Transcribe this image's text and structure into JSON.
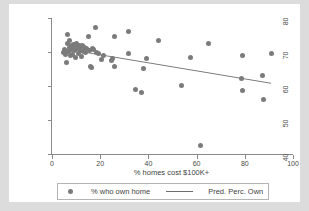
{
  "chart_data": {
    "type": "scatter",
    "title": "",
    "xlabel": "% homes cost $100K+",
    "ylabel": "",
    "xlim": [
      0,
      100
    ],
    "ylim": [
      40,
      80
    ],
    "xticks": [
      0,
      20,
      40,
      60,
      80,
      100
    ],
    "yticks": [
      40,
      50,
      60,
      70,
      80
    ],
    "grid": false,
    "legend_position": "below",
    "marker_color": "#7b7b7b",
    "line_color": "#6e6e6e",
    "plot_background": "#ffffff",
    "figure_background": "#dcdcdc",
    "series": [
      {
        "name": "% who own home",
        "type": "scatter",
        "points": [
          [
            4.6,
            69.9
          ],
          [
            5.2,
            70.8
          ],
          [
            5.6,
            69.4
          ],
          [
            6.0,
            66.9
          ],
          [
            6.3,
            75.1
          ],
          [
            6.6,
            72.6
          ],
          [
            6.8,
            70.2
          ],
          [
            7.1,
            73.4
          ],
          [
            7.4,
            71.2
          ],
          [
            7.6,
            68.9
          ],
          [
            7.9,
            70.6
          ],
          [
            8.2,
            71.9
          ],
          [
            8.5,
            69.2
          ],
          [
            8.9,
            72.1
          ],
          [
            9.2,
            70.4
          ],
          [
            9.5,
            71.5
          ],
          [
            9.8,
            68.5
          ],
          [
            10.1,
            72.4
          ],
          [
            10.4,
            70.9
          ],
          [
            10.8,
            71.7
          ],
          [
            11.1,
            69.6
          ],
          [
            11.4,
            72.0
          ],
          [
            11.7,
            70.3
          ],
          [
            12.0,
            71.3
          ],
          [
            12.4,
            68.7
          ],
          [
            12.8,
            71.8
          ],
          [
            13.2,
            70.1
          ],
          [
            13.6,
            71.4
          ],
          [
            14.0,
            69.8
          ],
          [
            14.5,
            71.0
          ],
          [
            15.0,
            74.6
          ],
          [
            15.4,
            70.5
          ],
          [
            15.9,
            65.6
          ],
          [
            16.2,
            65.3
          ],
          [
            16.7,
            71.1
          ],
          [
            17.3,
            70.7
          ],
          [
            18.0,
            77.2
          ],
          [
            18.4,
            70.0
          ],
          [
            19.1,
            69.5
          ],
          [
            20.6,
            67.7
          ],
          [
            21.4,
            69.1
          ],
          [
            24.6,
            67.6
          ],
          [
            25.3,
            68.1
          ],
          [
            25.8,
            74.5
          ],
          [
            26.1,
            65.6
          ],
          [
            31.6,
            75.9
          ],
          [
            31.9,
            69.5
          ],
          [
            34.8,
            59.1
          ],
          [
            37.3,
            58.2
          ],
          [
            38.1,
            65.2
          ],
          [
            39.4,
            68.2
          ],
          [
            44.2,
            73.3
          ],
          [
            53.9,
            60.2
          ],
          [
            57.6,
            68.4
          ],
          [
            61.8,
            42.5
          ],
          [
            64.8,
            72.6
          ],
          [
            78.6,
            62.3
          ],
          [
            78.9,
            69.0
          ],
          [
            79.1,
            58.6
          ],
          [
            87.4,
            63.0
          ],
          [
            87.9,
            56.0
          ],
          [
            90.9,
            69.6
          ]
        ]
      },
      {
        "name": "Pred. Perc. Own",
        "type": "line",
        "points": [
          [
            4.6,
            71.0
          ],
          [
            90.9,
            60.8
          ]
        ]
      }
    ]
  },
  "axis": {
    "x_title": "% homes cost $100K+",
    "x_tick_labels": [
      "0",
      "20",
      "40",
      "60",
      "80",
      "100"
    ],
    "y_tick_labels": [
      "40",
      "50",
      "60",
      "70",
      "80"
    ]
  },
  "legend": {
    "scatter_label": "% who own home",
    "line_label": "Pred. Perc. Own"
  }
}
